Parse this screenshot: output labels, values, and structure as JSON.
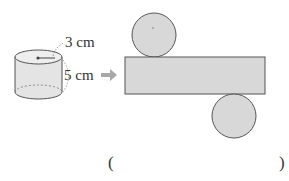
{
  "figure": {
    "type": "cylinder-net",
    "cylinder": {
      "radius_label": "3 cm",
      "height_label": "5 cm"
    },
    "arrow": "right-arrow",
    "net": {
      "parts": [
        "top-circle",
        "lateral-rectangle",
        "bottom-circle"
      ]
    },
    "colors": {
      "fill": "#d8d8d8",
      "stroke": "#555555",
      "arrow": "#a8a8a8"
    }
  },
  "answer": {
    "open_paren": "(",
    "close_paren": ")",
    "value": ""
  }
}
